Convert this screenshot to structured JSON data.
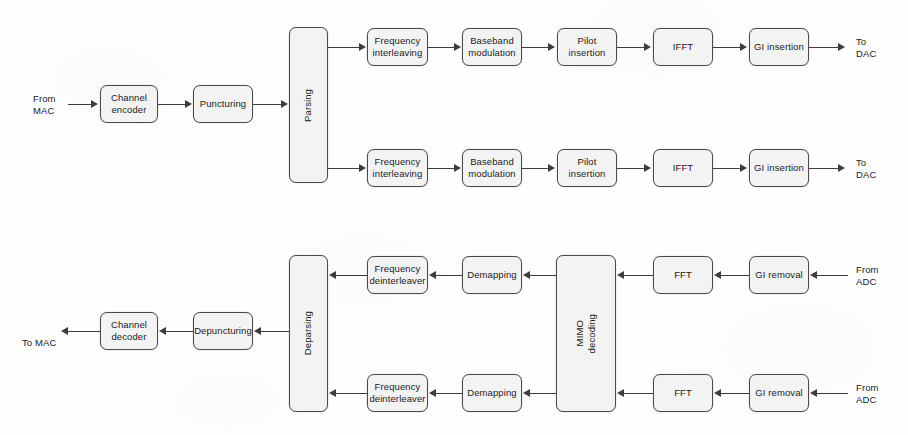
{
  "diagram": {
    "background_color": "#fefefe",
    "box_fill_color": "#f3f3f3",
    "box_border_color": "#4a4a4a",
    "line_color": "#3d3d3d"
  },
  "transmitter": {
    "input_label": "From\nMAC",
    "common_blocks": [
      {
        "label": "Channel\nencoder"
      },
      {
        "label": "Puncturing"
      },
      {
        "label": "Parsing",
        "orientation": "vertical"
      }
    ],
    "branches": [
      {
        "blocks": [
          {
            "label": "Frequency\ninterleaving"
          },
          {
            "label": "Baseband\nmodulation"
          },
          {
            "label": "Pilot\ninsertion"
          },
          {
            "label": "IFFT"
          },
          {
            "label": "GI insertion"
          }
        ],
        "output_label": "To\nDAC"
      },
      {
        "blocks": [
          {
            "label": "Frequency\ninterleaving"
          },
          {
            "label": "Baseband\nmodulation"
          },
          {
            "label": "Pilot\ninsertion"
          },
          {
            "label": "IFFT"
          },
          {
            "label": "GI insertion"
          }
        ],
        "output_label": "To\nDAC"
      }
    ]
  },
  "receiver": {
    "output_label": "To MAC",
    "common_blocks": [
      {
        "label": "Channel\ndecoder"
      },
      {
        "label": "Depuncturing"
      },
      {
        "label": "Deparsing",
        "orientation": "vertical"
      },
      {
        "label": "MIMO\ndecoding",
        "orientation": "vertical"
      }
    ],
    "branches": [
      {
        "blocks": [
          {
            "label": "Frequency\ndeinterleaver"
          },
          {
            "label": "Demapping"
          },
          {
            "label": "FFT"
          },
          {
            "label": "GI removal"
          }
        ],
        "input_label": "From\nADC"
      },
      {
        "blocks": [
          {
            "label": "Frequency\ndeinterleaver"
          },
          {
            "label": "Demapping"
          },
          {
            "label": "FFT"
          },
          {
            "label": "GI removal"
          }
        ],
        "input_label": "From\nADC"
      }
    ]
  }
}
